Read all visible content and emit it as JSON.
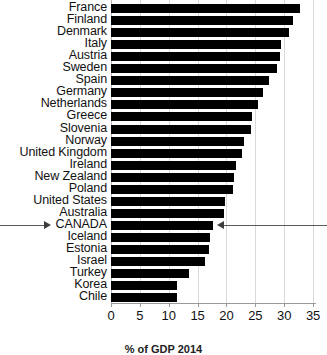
{
  "chart_data": {
    "type": "bar",
    "orientation": "horizontal",
    "title": "",
    "xlabel": "% of GDP 2014",
    "ylabel": "",
    "xlim": [
      0,
      35.5
    ],
    "xticks": [
      0,
      5,
      10,
      15,
      20,
      25,
      30,
      35
    ],
    "grid": true,
    "legend": false,
    "bar_color": "#000000",
    "categories": [
      "France",
      "Finland",
      "Denmark",
      "Italy",
      "Austria",
      "Sweden",
      "Spain",
      "Germany",
      "Netherlands",
      "Greece",
      "Slovenia",
      "Norway",
      "United Kingdom",
      "Ireland",
      "New Zealand",
      "Poland",
      "United States",
      "Australia",
      "CANADA",
      "Iceland",
      "Estonia",
      "Israel",
      "Turkey",
      "Korea",
      "Chile"
    ],
    "values": [
      32.8,
      31.6,
      30.9,
      29.5,
      29.2,
      28.8,
      27.3,
      26.4,
      25.4,
      24.5,
      24.3,
      23.0,
      22.6,
      21.7,
      21.3,
      21.2,
      19.8,
      19.6,
      17.6,
      17.2,
      17.0,
      16.2,
      13.5,
      11.5,
      11.4
    ],
    "annotations": [
      {
        "name": "canada-left-arrow",
        "target_category": "CANADA",
        "direction": "right",
        "description": "Arrow pointing right toward the CANADA axis label"
      },
      {
        "name": "canada-right-arrow",
        "target_category": "CANADA",
        "direction": "left",
        "description": "Arrow pointing left toward the end of the CANADA bar"
      }
    ]
  }
}
